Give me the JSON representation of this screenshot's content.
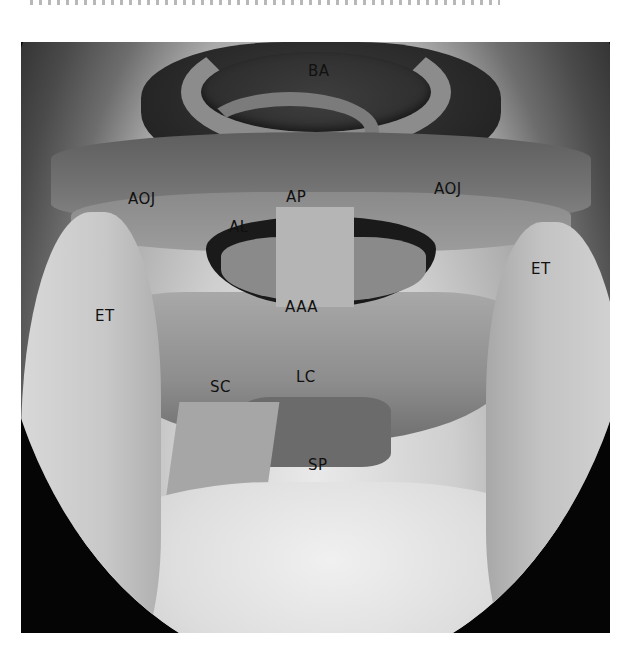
{
  "figure": {
    "labels": [
      {
        "id": "BA",
        "text": "BA",
        "x": 308,
        "y": 70
      },
      {
        "id": "AP",
        "text": "AP",
        "x": 286,
        "y": 196
      },
      {
        "id": "AOJ-left",
        "text": "AOJ",
        "x": 128,
        "y": 198
      },
      {
        "id": "AOJ-right",
        "text": "AOJ",
        "x": 434,
        "y": 188
      },
      {
        "id": "AL",
        "text": "AL",
        "x": 229,
        "y": 226
      },
      {
        "id": "ET-left",
        "text": "ET",
        "x": 95,
        "y": 315
      },
      {
        "id": "ET-right",
        "text": "ET",
        "x": 531,
        "y": 268
      },
      {
        "id": "AAA",
        "text": "AAA",
        "x": 285,
        "y": 306
      },
      {
        "id": "LC",
        "text": "LC",
        "x": 296,
        "y": 376
      },
      {
        "id": "SC",
        "text": "SC",
        "x": 210,
        "y": 386
      },
      {
        "id": "SP",
        "text": "SP",
        "x": 308,
        "y": 464
      }
    ]
  }
}
